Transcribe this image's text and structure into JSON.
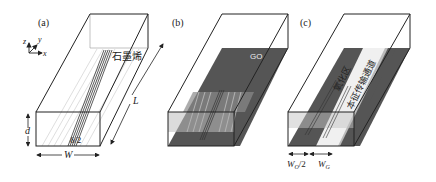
{
  "figure": {
    "panels": [
      {
        "id": "a",
        "label": "(a)",
        "material_label": "石墨烯",
        "dim_depth": "d",
        "dim_width": "W",
        "dim_length": "L",
        "dim_half_thickness": "δ/2",
        "axes": {
          "z": "z",
          "y": "y",
          "x": "x"
        }
      },
      {
        "id": "b",
        "label": "(b)",
        "layer_label": "GO"
      },
      {
        "id": "c",
        "label": "(c)",
        "oxidized_region_label": "氧化区",
        "channel_label": "本征传输通道",
        "dim_half_width": "W_O/2",
        "dim_width": "W_G",
        "dim_half_width_main": "W",
        "dim_half_width_sub": "O",
        "dim_half_width_suffix": "/2",
        "dim_width_main": "W",
        "dim_width_sub": "G"
      }
    ],
    "colors": {
      "outline": "#222222",
      "go_layer": "#555555",
      "graphene_lines": "#333333",
      "light_lines": "#bdbdbd",
      "white_band": "#f2f2f2"
    }
  }
}
